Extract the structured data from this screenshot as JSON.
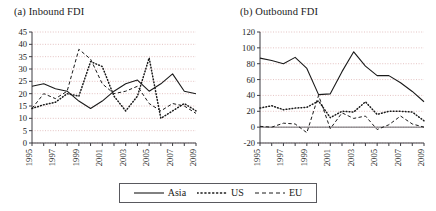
{
  "figure": {
    "background": "#ffffff",
    "axis_color": "#3d3d42",
    "grid_color": "#d9a9a9",
    "series_color": "#1a1a1a"
  },
  "panels": [
    {
      "id": "panel-a",
      "title": "(a) Inbound FDI"
    },
    {
      "id": "panel-b",
      "title": "(b) Outbound FDI"
    }
  ],
  "legend": {
    "position": "bottom-center",
    "entries": [
      {
        "label": "Asia",
        "style": "solid",
        "icon": "solid-line-icon"
      },
      {
        "label": "US",
        "style": "dotted",
        "icon": "dotted-line-icon"
      },
      {
        "label": "EU",
        "style": "dashed",
        "icon": "dashed-line-icon"
      }
    ]
  },
  "chart_data": [
    {
      "type": "line",
      "title": "(a) Inbound FDI",
      "xlabel": "",
      "ylabel": "",
      "grid": true,
      "legend_position": "bottom",
      "x": [
        1995,
        1996,
        1997,
        1998,
        1999,
        2000,
        2001,
        2002,
        2003,
        2004,
        2005,
        2006,
        2007,
        2008,
        2009
      ],
      "tick_labels_x": [
        "1995",
        "1997",
        "1999",
        "2001",
        "2003",
        "2005",
        "2007",
        "2009"
      ],
      "ylim": [
        0,
        45
      ],
      "yticks": [
        0,
        5,
        10,
        15,
        20,
        25,
        30,
        35,
        40,
        45
      ],
      "series": [
        {
          "name": "Asia",
          "style": "solid",
          "values": [
            23,
            24,
            22,
            21,
            17,
            14,
            17,
            21,
            24,
            25.5,
            21,
            24,
            28,
            21,
            20
          ]
        },
        {
          "name": "US",
          "style": "dotted",
          "values": [
            14,
            15.5,
            16.5,
            20,
            19,
            33,
            31,
            19,
            13,
            19,
            34.5,
            10,
            13,
            16,
            13
          ]
        },
        {
          "name": "EU",
          "style": "dashed",
          "values": [
            14,
            20,
            18,
            21,
            38,
            34,
            24,
            20,
            21,
            23,
            16,
            13,
            16,
            15,
            12
          ]
        }
      ]
    },
    {
      "type": "line",
      "title": "(b) Outbound FDI",
      "xlabel": "",
      "ylabel": "",
      "grid": true,
      "legend_position": "bottom",
      "x": [
        1995,
        1996,
        1997,
        1998,
        1999,
        2000,
        2001,
        2002,
        2003,
        2004,
        2005,
        2006,
        2007,
        2008,
        2009
      ],
      "tick_labels_x": [
        "1995",
        "1997",
        "1999",
        "2001",
        "2003",
        "2005",
        "2007",
        "2009"
      ],
      "ylim": [
        -20,
        120
      ],
      "yticks": [
        -20,
        0,
        20,
        40,
        60,
        80,
        100,
        120
      ],
      "series": [
        {
          "name": "Asia",
          "style": "solid",
          "values": [
            87,
            84,
            80,
            88,
            74,
            41,
            42,
            70,
            95,
            77,
            65,
            65,
            56,
            45,
            32
          ]
        },
        {
          "name": "US",
          "style": "dotted",
          "values": [
            24,
            27,
            22,
            24,
            25,
            33,
            12,
            20,
            19,
            32,
            16,
            20,
            20,
            19,
            8
          ]
        },
        {
          "name": "EU",
          "style": "dashed",
          "values": [
            1,
            0,
            5,
            4,
            -7,
            40,
            -2,
            18,
            11,
            14,
            -3,
            3,
            14,
            4,
            0
          ]
        }
      ]
    }
  ]
}
